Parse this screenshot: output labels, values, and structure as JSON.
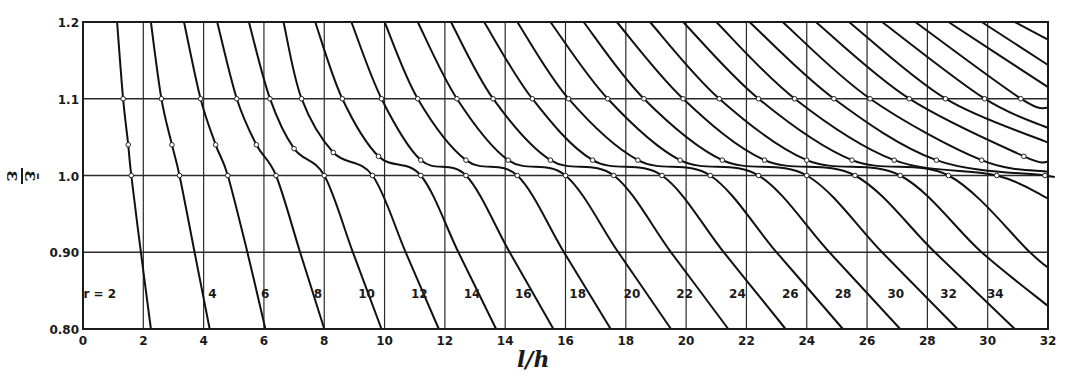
{
  "chart_data": {
    "type": "line",
    "title": "",
    "xlabel": "l/h",
    "ylabel": "ε̄/ε",
    "xlim": [
      0,
      32
    ],
    "ylim": [
      0.8,
      1.2
    ],
    "grid": true,
    "legend_position": "inline labels near bottom",
    "x_ticks": [
      0,
      2,
      4,
      6,
      8,
      10,
      12,
      14,
      16,
      18,
      20,
      22,
      24,
      26,
      28,
      30,
      32
    ],
    "x_tick_labels": [
      "0",
      "2",
      "4",
      "6",
      "8",
      "10",
      "12",
      "14",
      "16",
      "18",
      "20",
      "22",
      "24",
      "26",
      "28",
      "30",
      "32"
    ],
    "y_ticks": [
      0.8,
      0.9,
      1.0,
      1.1,
      1.2
    ],
    "y_tick_labels": [
      "0.80",
      "0.90",
      "1.0",
      "1.1",
      "1.2"
    ],
    "annotations": [
      "r = 2",
      "4",
      "6",
      "8",
      "10",
      "12",
      "14",
      "16",
      "18",
      "20",
      "22",
      "24",
      "26",
      "28",
      "30",
      "32",
      "34"
    ],
    "series": [
      {
        "name": "r=2",
        "label": "r = 2",
        "points": [
          [
            1.13,
            1.2
          ],
          [
            1.33,
            1.1
          ],
          [
            1.5,
            1.04
          ],
          [
            1.6,
            1.0
          ],
          [
            1.92,
            0.9
          ],
          [
            2.25,
            0.8
          ]
        ]
      },
      {
        "name": "r=4",
        "label": "4",
        "points": [
          [
            2.25,
            1.2
          ],
          [
            2.6,
            1.1
          ],
          [
            2.95,
            1.04
          ],
          [
            3.2,
            1.0
          ],
          [
            3.7,
            0.9
          ],
          [
            4.2,
            0.8
          ]
        ]
      },
      {
        "name": "r=6",
        "label": "6",
        "points": [
          [
            3.35,
            1.2
          ],
          [
            3.9,
            1.1
          ],
          [
            4.4,
            1.04
          ],
          [
            4.8,
            1.0
          ],
          [
            5.45,
            0.9
          ],
          [
            6.05,
            0.8
          ]
        ]
      },
      {
        "name": "r=8",
        "label": "8",
        "points": [
          [
            4.45,
            1.2
          ],
          [
            5.1,
            1.1
          ],
          [
            5.75,
            1.04
          ],
          [
            6.4,
            1.0
          ],
          [
            7.2,
            0.9
          ],
          [
            8.0,
            0.8
          ]
        ]
      },
      {
        "name": "r=10",
        "label": "10",
        "points": [
          [
            5.5,
            1.2
          ],
          [
            6.2,
            1.1
          ],
          [
            7.0,
            1.035
          ],
          [
            8.0,
            1.0
          ],
          [
            8.95,
            0.9
          ],
          [
            9.9,
            0.8
          ]
        ]
      },
      {
        "name": "r=12",
        "label": "12",
        "points": [
          [
            6.65,
            1.2
          ],
          [
            7.25,
            1.1
          ],
          [
            8.3,
            1.03
          ],
          [
            9.6,
            1.0
          ],
          [
            10.7,
            0.9
          ],
          [
            11.8,
            0.8
          ]
        ]
      },
      {
        "name": "r=14",
        "label": "14",
        "points": [
          [
            7.7,
            1.2
          ],
          [
            8.6,
            1.1
          ],
          [
            9.8,
            1.025
          ],
          [
            11.2,
            1.0
          ],
          [
            12.45,
            0.9
          ],
          [
            13.7,
            0.8
          ]
        ]
      },
      {
        "name": "r=16",
        "label": "16",
        "points": [
          [
            8.9,
            1.2
          ],
          [
            9.9,
            1.1
          ],
          [
            11.2,
            1.02
          ],
          [
            12.7,
            1.0
          ],
          [
            14.15,
            0.9
          ],
          [
            15.6,
            0.8
          ]
        ]
      },
      {
        "name": "r=18",
        "label": "18",
        "points": [
          [
            10.0,
            1.2
          ],
          [
            11.1,
            1.1
          ],
          [
            12.7,
            1.02
          ],
          [
            14.4,
            1.0
          ],
          [
            15.95,
            0.9
          ],
          [
            17.5,
            0.8
          ]
        ]
      },
      {
        "name": "r=20",
        "label": "20",
        "points": [
          [
            11.1,
            1.2
          ],
          [
            12.4,
            1.1
          ],
          [
            14.1,
            1.02
          ],
          [
            16.0,
            1.0
          ],
          [
            17.75,
            0.9
          ],
          [
            19.5,
            0.8
          ]
        ]
      },
      {
        "name": "r=22",
        "label": "22",
        "points": [
          [
            12.2,
            1.2
          ],
          [
            13.6,
            1.1
          ],
          [
            15.5,
            1.02
          ],
          [
            17.6,
            1.0
          ],
          [
            19.5,
            0.9
          ],
          [
            21.4,
            0.8
          ]
        ]
      },
      {
        "name": "r=24",
        "label": "24",
        "points": [
          [
            13.3,
            1.2
          ],
          [
            14.9,
            1.1
          ],
          [
            16.9,
            1.02
          ],
          [
            19.2,
            1.0
          ],
          [
            21.25,
            0.9
          ],
          [
            23.3,
            0.8
          ]
        ]
      },
      {
        "name": "r=26",
        "label": "26",
        "points": [
          [
            14.4,
            1.2
          ],
          [
            16.1,
            1.1
          ],
          [
            18.4,
            1.02
          ],
          [
            20.8,
            1.0
          ],
          [
            23.0,
            0.9
          ],
          [
            25.2,
            0.8
          ]
        ]
      },
      {
        "name": "r=28",
        "label": "28",
        "points": [
          [
            15.5,
            1.2
          ],
          [
            17.4,
            1.1
          ],
          [
            19.8,
            1.02
          ],
          [
            22.4,
            1.0
          ],
          [
            24.75,
            0.9
          ],
          [
            27.1,
            0.8
          ]
        ]
      },
      {
        "name": "r=30",
        "label": "30",
        "points": [
          [
            16.6,
            1.2
          ],
          [
            18.6,
            1.1
          ],
          [
            21.2,
            1.02
          ],
          [
            24.0,
            1.0
          ],
          [
            26.5,
            0.9
          ],
          [
            29.0,
            0.8
          ]
        ]
      },
      {
        "name": "r=32",
        "label": "32",
        "points": [
          [
            17.7,
            1.2
          ],
          [
            19.9,
            1.1
          ],
          [
            22.6,
            1.02
          ],
          [
            25.6,
            1.0
          ],
          [
            28.25,
            0.9
          ],
          [
            30.9,
            0.8
          ]
        ]
      },
      {
        "name": "r=34",
        "label": "34",
        "points": [
          [
            18.8,
            1.2
          ],
          [
            21.1,
            1.1
          ],
          [
            24.0,
            1.02
          ],
          [
            27.1,
            1.0
          ],
          [
            29.8,
            0.9
          ],
          [
            32.0,
            0.83
          ]
        ]
      },
      {
        "name": "r=36",
        "label": "",
        "points": [
          [
            19.9,
            1.2
          ],
          [
            22.4,
            1.1
          ],
          [
            25.5,
            1.02
          ],
          [
            28.7,
            1.0
          ],
          [
            31.4,
            0.9
          ],
          [
            32.0,
            0.88
          ]
        ]
      },
      {
        "name": "r=38",
        "label": "",
        "points": [
          [
            21.0,
            1.2
          ],
          [
            23.6,
            1.1
          ],
          [
            26.9,
            1.02
          ],
          [
            30.3,
            1.0
          ],
          [
            32.0,
            0.97
          ]
        ]
      },
      {
        "name": "r=40",
        "label": "",
        "points": [
          [
            22.1,
            1.2
          ],
          [
            24.9,
            1.1
          ],
          [
            28.3,
            1.02
          ],
          [
            31.9,
            1.0
          ],
          [
            32.0,
            0.999
          ]
        ]
      },
      {
        "name": "r=42",
        "label": "",
        "points": [
          [
            23.2,
            1.2
          ],
          [
            26.1,
            1.1
          ],
          [
            29.8,
            1.02
          ],
          [
            32.0,
            1.005
          ]
        ]
      },
      {
        "name": "r=44",
        "label": "",
        "points": [
          [
            24.3,
            1.2
          ],
          [
            27.4,
            1.1
          ],
          [
            31.2,
            1.025
          ],
          [
            32.0,
            1.018
          ]
        ]
      },
      {
        "name": "r=46",
        "label": "",
        "points": [
          [
            25.4,
            1.2
          ],
          [
            28.6,
            1.1
          ],
          [
            32.0,
            1.043
          ]
        ]
      },
      {
        "name": "r=48",
        "label": "",
        "points": [
          [
            26.5,
            1.2
          ],
          [
            29.9,
            1.1
          ],
          [
            32.0,
            1.062
          ]
        ]
      },
      {
        "name": "r=50",
        "label": "",
        "points": [
          [
            27.6,
            1.2
          ],
          [
            31.1,
            1.1
          ],
          [
            32.0,
            1.088
          ]
        ]
      },
      {
        "name": "r=52",
        "label": "",
        "points": [
          [
            28.7,
            1.2
          ],
          [
            32.0,
            1.115
          ]
        ]
      },
      {
        "name": "r=54",
        "label": "",
        "points": [
          [
            29.8,
            1.2
          ],
          [
            32.0,
            1.144
          ]
        ]
      },
      {
        "name": "r=56",
        "label": "",
        "points": [
          [
            30.9,
            1.2
          ],
          [
            32.0,
            1.177
          ]
        ]
      }
    ]
  }
}
